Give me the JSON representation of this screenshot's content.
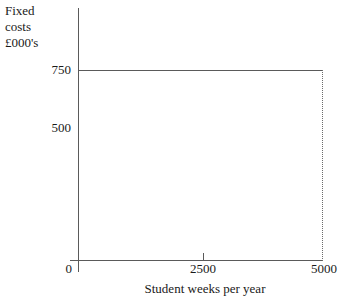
{
  "chart_data": {
    "type": "line",
    "title": "",
    "subtitle": "",
    "ylabel_lines": [
      "Fixed",
      "costs",
      "£000's"
    ],
    "ylabel": "Fixed costs £000's",
    "xlabel": "Student weeks per year",
    "xlim": [
      0,
      5000
    ],
    "ylim": [
      0,
      1000
    ],
    "grid": false,
    "legend": false,
    "legend_position": "none",
    "x_ticks": [
      {
        "value": 0,
        "label": "0",
        "has_mark": false
      },
      {
        "value": 2500,
        "label": "2500",
        "has_mark": true
      },
      {
        "value": 5000,
        "label": "5000",
        "has_mark": false
      }
    ],
    "y_ticks": [
      {
        "value": 750,
        "label": "750",
        "has_mark": false
      },
      {
        "value": 500,
        "label": "500",
        "has_mark": false
      }
    ],
    "series": [
      {
        "name": "Fixed costs",
        "style": "solid",
        "x": [
          0,
          5000
        ],
        "values": [
          750,
          750
        ]
      }
    ],
    "annotations": [
      {
        "name": "drop-line-at-5000",
        "style": "dotted",
        "from": [
          5000,
          750
        ],
        "to": [
          5000,
          0
        ]
      }
    ],
    "colors": {
      "axis": "#5a5a5a",
      "line": "#5a5a5a",
      "dotted": "#6b6b6b",
      "text": "#1a1a1a",
      "background": "#ffffff"
    }
  }
}
